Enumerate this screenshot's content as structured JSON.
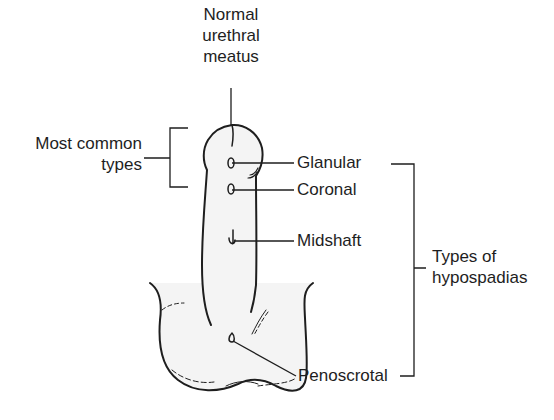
{
  "diagram": {
    "subject": "Types of hypospadias",
    "labels": {
      "normal_meatus": [
        "Normal",
        "urethral",
        "meatus"
      ],
      "most_common": [
        "Most common",
        "types"
      ],
      "glanular": "Glanular",
      "coronal": "Coronal",
      "midshaft": "Midshaft",
      "penoscrotal": "Penoscrotal",
      "types_of": [
        "Types of",
        "hypospadias"
      ]
    },
    "groups": {
      "most_common_types": [
        "Glanular",
        "Coronal"
      ],
      "types_of_hypospadias": [
        "Glanular",
        "Coronal",
        "Midshaft",
        "Penoscrotal"
      ]
    },
    "colors": {
      "line": "#1e1e1e",
      "text": "#1e1e1e",
      "fill": "#f4f4f4"
    }
  }
}
